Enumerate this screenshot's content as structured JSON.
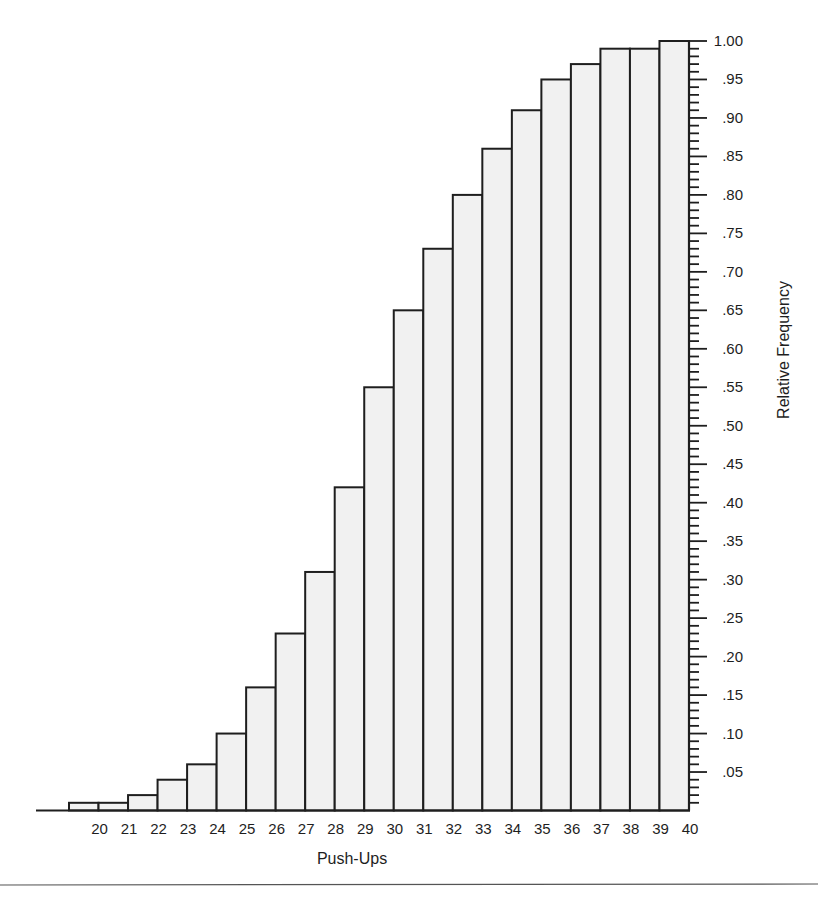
{
  "chart_data": {
    "type": "bar",
    "title": "",
    "xlabel": "Push-Ups",
    "ylabel": "Relative Frequency",
    "ylim": [
      0,
      1.0
    ],
    "y_axis_position": "right",
    "grid": false,
    "legend": null,
    "bar_style": "histogram (contiguous bars, cumulative relative frequency)",
    "bins": [
      {
        "from": 19,
        "to": 20,
        "value": 0.01
      },
      {
        "from": 20,
        "to": 21,
        "value": 0.01
      },
      {
        "from": 21,
        "to": 22,
        "value": 0.02
      },
      {
        "from": 22,
        "to": 23,
        "value": 0.04
      },
      {
        "from": 23,
        "to": 24,
        "value": 0.06
      },
      {
        "from": 24,
        "to": 25,
        "value": 0.1
      },
      {
        "from": 25,
        "to": 26,
        "value": 0.16
      },
      {
        "from": 26,
        "to": 27,
        "value": 0.23
      },
      {
        "from": 27,
        "to": 28,
        "value": 0.31
      },
      {
        "from": 28,
        "to": 29,
        "value": 0.42
      },
      {
        "from": 29,
        "to": 30,
        "value": 0.55
      },
      {
        "from": 30,
        "to": 31,
        "value": 0.65
      },
      {
        "from": 31,
        "to": 32,
        "value": 0.73
      },
      {
        "from": 32,
        "to": 33,
        "value": 0.8
      },
      {
        "from": 33,
        "to": 34,
        "value": 0.86
      },
      {
        "from": 34,
        "to": 35,
        "value": 0.91
      },
      {
        "from": 35,
        "to": 36,
        "value": 0.95
      },
      {
        "from": 36,
        "to": 37,
        "value": 0.97
      },
      {
        "from": 37,
        "to": 38,
        "value": 0.99
      },
      {
        "from": 38,
        "to": 39,
        "value": 0.99
      },
      {
        "from": 39,
        "to": 40,
        "value": 1.0
      }
    ],
    "categories": [
      "19-20",
      "20-21",
      "21-22",
      "22-23",
      "23-24",
      "24-25",
      "25-26",
      "26-27",
      "27-28",
      "28-29",
      "29-30",
      "30-31",
      "31-32",
      "32-33",
      "33-34",
      "34-35",
      "35-36",
      "36-37",
      "37-38",
      "38-39",
      "39-40"
    ],
    "values": [
      0.01,
      0.01,
      0.02,
      0.04,
      0.06,
      0.1,
      0.16,
      0.23,
      0.31,
      0.42,
      0.55,
      0.65,
      0.73,
      0.8,
      0.86,
      0.91,
      0.95,
      0.97,
      0.99,
      0.99,
      1.0
    ],
    "x_tick_labels": [
      "20",
      "21",
      "22",
      "23",
      "24",
      "25",
      "26",
      "27",
      "28",
      "29",
      "30",
      "31",
      "32",
      "33",
      "34",
      "35",
      "36",
      "37",
      "38",
      "39",
      "40"
    ],
    "y_tick_labels": [
      ".05",
      ".10",
      ".15",
      ".20",
      ".25",
      ".30",
      ".35",
      ".40",
      ".45",
      ".50",
      ".55",
      ".60",
      ".65",
      ".70",
      ".75",
      ".80",
      ".85",
      ".90",
      ".95",
      "1.00"
    ],
    "y_tick_values": [
      0.05,
      0.1,
      0.15,
      0.2,
      0.25,
      0.3,
      0.35,
      0.4,
      0.45,
      0.5,
      0.55,
      0.6,
      0.65,
      0.7,
      0.75,
      0.8,
      0.85,
      0.9,
      0.95,
      1.0
    ],
    "y_minor_tick_step": 0.01
  },
  "colors": {
    "bar_fill": "#f1f1f1",
    "bar_stroke": "#1e1e1e",
    "text": "#1e1e1e",
    "background": "#ffffff"
  }
}
